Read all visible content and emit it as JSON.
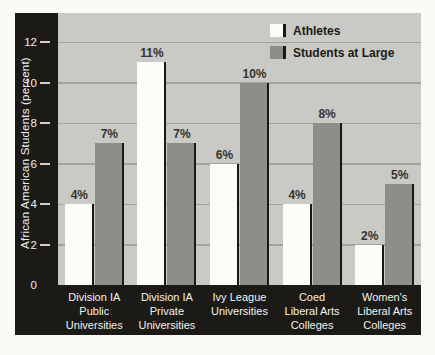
{
  "colors": {
    "page_bg": "#fbfaf7",
    "frame": "#1b1a16",
    "plot_bg": "#c9c9c5",
    "gridline": "#a2a29e",
    "athletes_bar": "#fcfcf9",
    "students_bar": "#8d8d8a",
    "bar_shadow": "#191813",
    "axis_text": "#efefe9"
  },
  "chart_data": {
    "type": "bar",
    "title": "",
    "xlabel": "",
    "ylabel": "African American Students (percent)",
    "categories": [
      [
        "Division IA",
        "Public",
        "Universities"
      ],
      [
        "Division IA",
        "Private",
        "Universities"
      ],
      [
        "Ivy League",
        "Universities"
      ],
      [
        "Coed",
        "Liberal Arts",
        "Colleges"
      ],
      [
        "Women's",
        "Liberal Arts",
        "Colleges"
      ]
    ],
    "series": [
      {
        "name": "Athletes",
        "color": "#fcfcf9",
        "values": [
          4,
          11,
          6,
          4,
          2
        ]
      },
      {
        "name": "Students at Large",
        "color": "#8d8d8a",
        "values": [
          7,
          7,
          10,
          8,
          5
        ]
      }
    ],
    "value_labels": [
      [
        "4%",
        "11%",
        "6%",
        "4%",
        "2%"
      ],
      [
        "7%",
        "7%",
        "10%",
        "8%",
        "5%"
      ]
    ],
    "value_label_suffix": "%",
    "yticks": [
      0,
      2,
      4,
      6,
      8,
      10,
      12
    ],
    "ylim": [
      0,
      13.4
    ],
    "grid": "horizontal",
    "legend_position": "top-right"
  }
}
